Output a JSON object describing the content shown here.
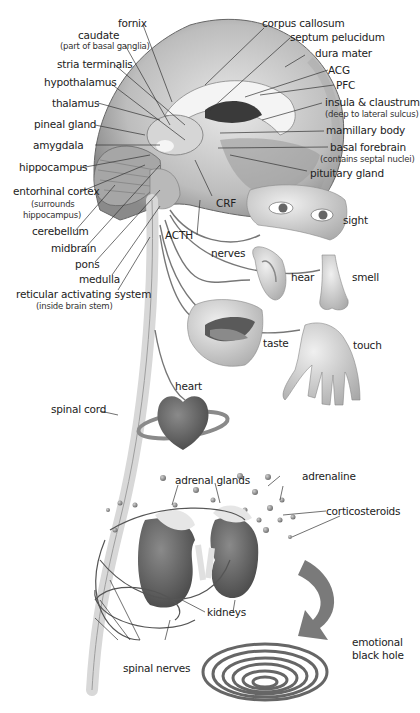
{
  "diagram": {
    "brain_labels": {
      "fornix": "fornix",
      "caudate": "caudate",
      "caudate_note": "(part of basal ganglia)",
      "stria_terminalis": "stria terminalis",
      "hypothalamus": "hypothalamus",
      "thalamus": "thalamus",
      "pineal_gland": "pineal gland",
      "amygdala": "amygdala",
      "hippocampus": "hippocampus",
      "entorhinal_cortex": "entorhinal cortex",
      "entorhinal_note_1": "(surrounds",
      "entorhinal_note_2": "hippocampus)",
      "cerebellum": "cerebellum",
      "midbrain": "midbrain",
      "pons": "pons",
      "medulla": "medulla",
      "reticular": "reticular activating system",
      "reticular_note": "(inside brain stem)",
      "corpus_callosum": "corpus callosum",
      "septum_pelucidum": "septum pelucidum",
      "dura_mater": "dura mater",
      "acg": "ACG",
      "pfc": "PFC",
      "insula": "insula & claustrum",
      "insula_note": "(deep to lateral sulcus)",
      "mamillary_body": "mamillary body",
      "basal_forebrain": "basal forebrain",
      "basal_forebrain_note": "(contains septal nuclei)",
      "pituitary_gland": "pituitary gland",
      "crf": "CRF",
      "acth": "ACTH"
    },
    "sense_labels": {
      "nerves": "nerves",
      "sight": "sight",
      "hear": "hear",
      "smell": "smell",
      "taste": "taste",
      "touch": "touch"
    },
    "body_labels": {
      "spinal_cord": "spinal cord",
      "heart": "heart",
      "adrenal_glands": "adrenal glands",
      "adrenaline": "adrenaline",
      "corticosteroids": "corticosteroids",
      "kidneys": "kidneys",
      "spinal_nerves": "spinal nerves",
      "emotional_1": "emotional",
      "emotional_2": "black hole"
    },
    "colors": {
      "background": "#ffffff",
      "line": "#333333",
      "tissue": "#9a9a9a",
      "dark_organ": "#5a5a5a",
      "text": "#222222"
    }
  }
}
